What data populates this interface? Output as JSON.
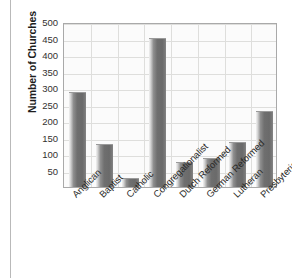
{
  "chart_data": {
    "type": "bar",
    "title": "",
    "xlabel": "",
    "ylabel": "Number of Churches",
    "categories": [
      "Anglican",
      "Baptist",
      "Catholic",
      "Congregationalist",
      "Dutch Reformed",
      "German Reformed",
      "Lutheran",
      "Presbyterian"
    ],
    "values": [
      287,
      130,
      26,
      453,
      77,
      88,
      136,
      230
    ],
    "ylim": [
      0,
      500
    ],
    "yticks": [
      50,
      100,
      150,
      200,
      250,
      300,
      350,
      400,
      450,
      500
    ],
    "ytick_labels": [
      "50",
      "100",
      "150",
      "200",
      "250",
      "300",
      "350",
      "400",
      "450",
      "500"
    ],
    "grid": true,
    "legend": "none",
    "bar_color": "#6f6f6f",
    "plot_background": "#fbfbfb",
    "gridline_color": "#dededc",
    "axis_color": "#a9a9a9"
  }
}
